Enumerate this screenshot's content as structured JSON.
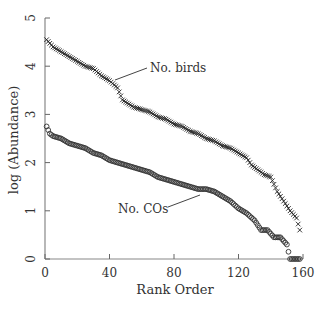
{
  "chart_data": {
    "type": "scatter",
    "title": "",
    "xlabel": "Rank Order",
    "ylabel": "log (Abundance)",
    "xlim": [
      0,
      160
    ],
    "ylim": [
      0,
      5
    ],
    "xticks": [
      0,
      40,
      80,
      120,
      160
    ],
    "yticks": [
      0,
      1,
      2,
      3,
      4,
      5
    ],
    "grid": false,
    "legend": "none (inline annotations)",
    "annotations": [
      {
        "text": "No. birds",
        "points_to_series": "No. birds",
        "at": [
          42,
          3.6
        ]
      },
      {
        "text": "No. COs",
        "points_to_series": "No. COs",
        "at": [
          100,
          1.45
        ]
      }
    ],
    "series": [
      {
        "name": "No. birds",
        "marker": "x",
        "x": [
          1,
          5,
          10,
          15,
          20,
          25,
          30,
          35,
          40,
          45,
          48,
          55,
          60,
          65,
          70,
          75,
          80,
          85,
          90,
          95,
          100,
          105,
          110,
          115,
          120,
          125,
          128,
          132,
          136,
          140,
          144,
          148,
          152,
          156,
          158
        ],
        "y": [
          4.55,
          4.4,
          4.3,
          4.2,
          4.1,
          4.0,
          3.95,
          3.8,
          3.7,
          3.55,
          3.3,
          3.15,
          3.1,
          3.05,
          2.95,
          2.9,
          2.8,
          2.75,
          2.65,
          2.6,
          2.5,
          2.45,
          2.35,
          2.3,
          2.2,
          2.1,
          1.95,
          1.85,
          1.75,
          1.7,
          1.4,
          1.2,
          1.0,
          0.85,
          0.6
        ]
      },
      {
        "name": "No. COs",
        "marker": "o",
        "x": [
          1,
          3,
          5,
          10,
          15,
          20,
          25,
          30,
          35,
          40,
          45,
          50,
          55,
          60,
          65,
          70,
          75,
          80,
          85,
          90,
          95,
          100,
          105,
          110,
          115,
          120,
          125,
          130,
          134,
          138,
          142,
          146,
          150,
          152,
          156,
          158
        ],
        "y": [
          2.75,
          2.6,
          2.55,
          2.5,
          2.4,
          2.35,
          2.3,
          2.2,
          2.15,
          2.05,
          2.0,
          1.95,
          1.9,
          1.85,
          1.8,
          1.7,
          1.65,
          1.6,
          1.55,
          1.5,
          1.45,
          1.45,
          1.4,
          1.3,
          1.2,
          1.05,
          0.95,
          0.8,
          0.6,
          0.6,
          0.45,
          0.45,
          0.3,
          0.0,
          0.0,
          0.0
        ]
      }
    ]
  },
  "labels": {
    "xlabel": "Rank Order",
    "ylabel": "log (Abundance)",
    "anno_birds": "No. birds",
    "anno_cos": "No. COs",
    "xticks": [
      "0",
      "40",
      "80",
      "120",
      "160"
    ],
    "yticks": [
      "0",
      "1",
      "2",
      "3",
      "4",
      "5"
    ]
  }
}
